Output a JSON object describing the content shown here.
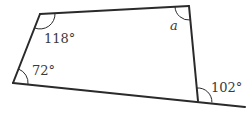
{
  "figure": {
    "type": "quadrilateral",
    "vertices": {
      "top_left": [
        40,
        14
      ],
      "top_right": [
        189,
        6
      ],
      "bottom_right": [
        198,
        101
      ],
      "bottom_left": [
        13,
        83
      ]
    },
    "extension_end": [
      245,
      107
    ],
    "angles": [
      {
        "name": "angle-top-left",
        "label": "118°",
        "x": 44,
        "y": 32
      },
      {
        "name": "angle-top-right",
        "label": "a",
        "x": 170,
        "y": 20,
        "italic": true
      },
      {
        "name": "angle-bottom-left",
        "label": "72°",
        "x": 32,
        "y": 65
      },
      {
        "name": "angle-exterior-bottom-right",
        "label": "102°",
        "x": 211,
        "y": 82
      }
    ]
  }
}
